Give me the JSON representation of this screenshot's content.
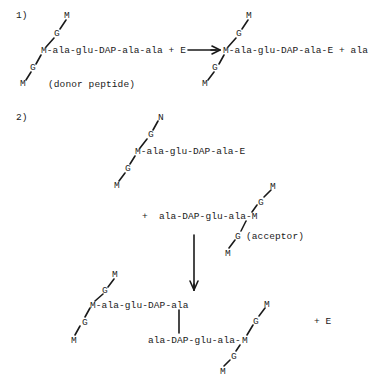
{
  "reaction1": {
    "label": "1)",
    "donor": {
      "top_m": "M",
      "top_g": "G",
      "chain": "M-ala-glu-DAP-ala-ala + E",
      "bottom_g": "G",
      "bottom_m": "M",
      "caption": "(donor peptide)"
    },
    "product": {
      "top_m": "M",
      "top_g": "G",
      "chain": "M-ala-glu-DAP-ala-E + ala",
      "bottom_g": "G",
      "bottom_m": "M"
    }
  },
  "reaction2": {
    "label": "2)",
    "intermediate": {
      "top_n": "N",
      "top_g": "G",
      "chain": "M-ala-glu-DAP-ala-E",
      "bottom_g": "G",
      "bottom_m": "M"
    },
    "acceptor": {
      "plus": "+",
      "chain": "ala-DAP-glu-ala-M",
      "top_g": "G",
      "top_m": "M",
      "bottom_g": "G",
      "bottom_m": "M",
      "caption": "(acceptor)"
    },
    "product": {
      "left_top_m": "M",
      "left_top_g": "G",
      "left_chain": "M-ala-glu-DAP-ala",
      "left_bottom_g": "G",
      "left_bottom_m": "M",
      "right_chain": "ala-DAP-glu-ala-",
      "right_m": "M",
      "right_top_g": "G",
      "right_top_m": "M",
      "right_bottom_g": "G",
      "right_bottom_m": "M",
      "plus_e": "+ E"
    }
  },
  "colors": {
    "ink": "#1a1a1a",
    "background": "#ffffff"
  }
}
